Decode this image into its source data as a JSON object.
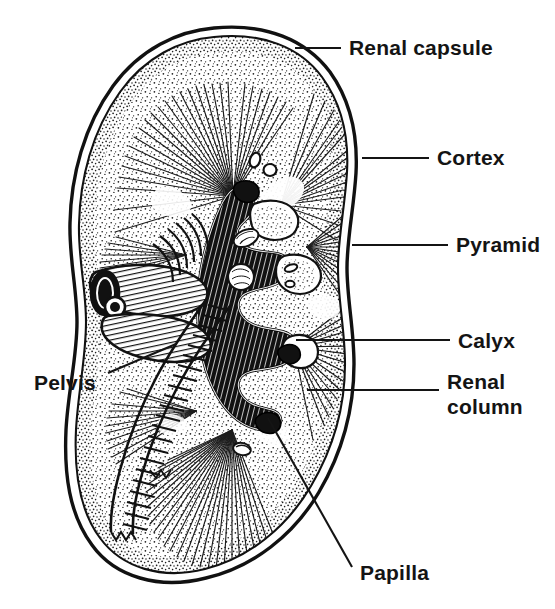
{
  "figure": {
    "style": "black-and-white stippled line drawing",
    "background_color": "#ffffff",
    "ink_color": "#141414"
  },
  "labels": [
    {
      "id": "renal-capsule",
      "text": "Renal capsule",
      "lines": [
        "Renal capsule"
      ],
      "text_x": 349,
      "text_y": 55,
      "leader": "M295,48 L341,48",
      "align": "start"
    },
    {
      "id": "cortex",
      "text": "Cortex",
      "lines": [
        "Cortex"
      ],
      "text_x": 437,
      "text_y": 165,
      "leader": "M362,158 L429,158",
      "align": "start"
    },
    {
      "id": "pyramid",
      "text": "Pyramid",
      "lines": [
        "Pyramid"
      ],
      "text_x": 456,
      "text_y": 252,
      "leader": "M352,245 L448,245",
      "align": "start"
    },
    {
      "id": "calyx",
      "text": "Calyx",
      "lines": [
        "Calyx"
      ],
      "text_x": 458,
      "text_y": 348,
      "leader": "M296,340 L450,340",
      "align": "start"
    },
    {
      "id": "renal-column",
      "text": "Renal column",
      "lines": [
        "Renal",
        "column"
      ],
      "text_x": 447,
      "text_y": 389,
      "leader": "M307,390 L439,390",
      "align": "start"
    },
    {
      "id": "papilla",
      "text": "Papilla",
      "lines": [
        "Papilla"
      ],
      "text_x": 360,
      "text_y": 580,
      "leader": "M268,418 L352,567",
      "align": "start"
    },
    {
      "id": "pelvis",
      "text": "Pelvis",
      "lines": [
        "Pelvis"
      ],
      "text_x": 98,
      "text_y": 390,
      "leader": "M108,373 L176,344",
      "align": "start"
    }
  ],
  "structures": [
    {
      "id": "renal-capsule",
      "name": "Renal capsule"
    },
    {
      "id": "cortex",
      "name": "Cortex"
    },
    {
      "id": "pyramid",
      "name": "Pyramid"
    },
    {
      "id": "calyx",
      "name": "Calyx"
    },
    {
      "id": "renal-column",
      "name": "Renal column"
    },
    {
      "id": "papilla",
      "name": "Papilla"
    },
    {
      "id": "pelvis",
      "name": "Pelvis"
    },
    {
      "id": "renal-vessels",
      "name": "Renal vessels"
    },
    {
      "id": "ureter",
      "name": "Ureter"
    }
  ]
}
